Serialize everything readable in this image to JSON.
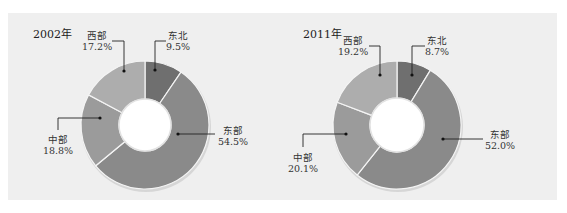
{
  "chart_data": [
    {
      "type": "pie",
      "variant": "donut",
      "title": "2002年",
      "categories": [
        "东北",
        "东部",
        "中部",
        "西部"
      ],
      "values": [
        9.5,
        54.5,
        18.8,
        17.2
      ],
      "value_labels": [
        "9.5%",
        "54.5%",
        "18.8%",
        "17.2%"
      ],
      "colors": [
        "#6f6f6f",
        "#8a8a8a",
        "#9b9b9b",
        "#adadad"
      ],
      "start_angle_deg": 0,
      "direction": "clockwise",
      "unit": "%"
    },
    {
      "type": "pie",
      "variant": "donut",
      "title": "2011年",
      "categories": [
        "东北",
        "东部",
        "中部",
        "西部"
      ],
      "values": [
        8.7,
        52.0,
        20.1,
        19.2
      ],
      "value_labels": [
        "8.7%",
        "52.0%",
        "20.1%",
        "19.2%"
      ],
      "colors": [
        "#6f6f6f",
        "#8a8a8a",
        "#9b9b9b",
        "#adadad"
      ],
      "start_angle_deg": 0,
      "direction": "clockwise",
      "unit": "%"
    }
  ],
  "charts": [
    {
      "title": "2002年",
      "labels": {
        "dongbei": {
          "name": "东北",
          "value": "9.5%"
        },
        "dongbu": {
          "name": "东部",
          "value": "54.5%"
        },
        "zhongbu": {
          "name": "中部",
          "value": "18.8%"
        },
        "xibu": {
          "name": "西部",
          "value": "17.2%"
        }
      }
    },
    {
      "title": "2011年",
      "labels": {
        "dongbei": {
          "name": "东北",
          "value": "8.7%"
        },
        "dongbu": {
          "name": "东部",
          "value": "52.0%"
        },
        "zhongbu": {
          "name": "中部",
          "value": "20.1%"
        },
        "xibu": {
          "name": "西部",
          "value": "19.2%"
        }
      }
    }
  ],
  "style": {
    "panel_bg": "#efefef",
    "separator": "#f4f4f4",
    "leader_line": "#222222"
  }
}
